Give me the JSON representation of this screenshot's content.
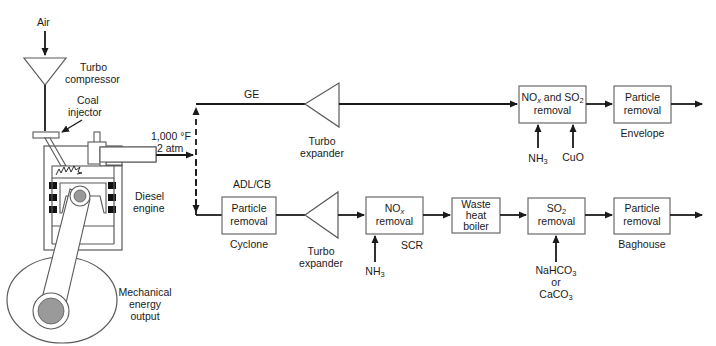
{
  "diagram": {
    "type": "process-flow",
    "engine": {
      "air_label": "Air",
      "compressor_label_1": "Turbo",
      "compressor_label_2": "compressor",
      "injector_label_1": "Coal",
      "injector_label_2": "injector",
      "engine_label_1": "Diesel",
      "engine_label_2": "engine",
      "output_label_1": "Mechanical",
      "output_label_2": "energy",
      "output_label_3": "output",
      "exhaust_temp": "1,000 °F",
      "exhaust_pressure": "2 atm"
    },
    "top_train": {
      "name": "GE",
      "expander_label_1": "Turbo",
      "expander_label_2": "expander",
      "box1_line1": "NOx and SO2",
      "box1_line2": "removal",
      "box1_input_1": "NH3",
      "box1_input_2": "CuO",
      "box2_line1": "Particle",
      "box2_line2": "removal",
      "box2_caption": "Envelope"
    },
    "bottom_train": {
      "name": "ADL/CB",
      "box1_line1": "Particle",
      "box1_line2": "removal",
      "box1_caption": "Cyclone",
      "expander_label_1": "Turbo",
      "expander_label_2": "expander",
      "box2_line1": "NOx",
      "box2_line2": "removal",
      "box2_caption": "SCR",
      "box2_input": "NH3",
      "box3_line1": "Waste",
      "box3_line2": "heat",
      "box3_line3": "boiler",
      "box4_line1": "SO2",
      "box4_line2": "removal",
      "box4_input_1": "NaHCO3",
      "box4_input_2": "or",
      "box4_input_3": "CaCO3",
      "box5_line1": "Particle",
      "box5_line2": "removal",
      "box5_caption": "Baghouse"
    }
  }
}
